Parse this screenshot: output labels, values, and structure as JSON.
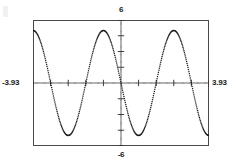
{
  "plot": {
    "x_min_label": "-3.93",
    "x_max_label": "3.93",
    "y_max_label": "6",
    "y_min_label": "-6",
    "frame_color": "#4a4a4a",
    "curve_color": "#1a1a1a",
    "axis_color": "#2b2b2b"
  },
  "chart_data": {
    "type": "line",
    "title": "",
    "subtitle": "",
    "xlabel": "",
    "ylabel": "",
    "xlim": [
      -3.93,
      3.93
    ],
    "ylim": [
      -6,
      6
    ],
    "grid": false,
    "legend": null,
    "style": "dotted-pixel-trace",
    "x_tick_labels": [
      "-3.93",
      "3.93"
    ],
    "y_tick_labels": [
      "6",
      "-6"
    ],
    "x_tick_spacing": 0.7854,
    "y_tick_spacing": 1.5,
    "annotations": [],
    "series": [
      {
        "name": "y = -5 sin(2x)",
        "expression": "-5*sin(2*x)",
        "amplitude": 5,
        "period": 3.14159,
        "x": [
          -3.93,
          -3.83,
          -3.73,
          -3.63,
          -3.53,
          -3.43,
          -3.33,
          -3.23,
          -3.13,
          -3.03,
          -2.93,
          -2.83,
          -2.73,
          -2.63,
          -2.53,
          -2.43,
          -2.33,
          -2.23,
          -2.13,
          -2.03,
          -1.93,
          -1.83,
          -1.73,
          -1.63,
          -1.53,
          -1.43,
          -1.33,
          -1.23,
          -1.13,
          -1.03,
          -0.93,
          -0.83,
          -0.73,
          -0.63,
          -0.53,
          -0.43,
          -0.33,
          -0.23,
          -0.13,
          -0.03,
          0.07,
          0.17,
          0.27,
          0.37,
          0.47,
          0.57,
          0.67,
          0.77,
          0.87,
          0.97,
          1.07,
          1.17,
          1.27,
          1.37,
          1.47,
          1.57,
          1.67,
          1.77,
          1.87,
          1.97,
          2.07,
          2.17,
          2.27,
          2.37,
          2.47,
          2.57,
          2.67,
          2.77,
          2.87,
          2.97,
          3.07,
          3.17,
          3.27,
          3.37,
          3.47,
          3.57,
          3.67,
          3.77,
          3.87,
          3.93
        ],
        "y": [
          -0.71,
          -1.64,
          -2.53,
          -3.33,
          -4.03,
          -4.58,
          -4.9,
          -4.99,
          -4.87,
          -4.52,
          -3.96,
          -3.22,
          -2.34,
          -1.37,
          -0.34,
          0.69,
          1.7,
          2.63,
          3.44,
          4.11,
          4.61,
          4.91,
          4.99,
          4.85,
          4.48,
          3.9,
          3.15,
          2.25,
          1.27,
          0.24,
          -0.8,
          -1.79,
          -2.7,
          -3.49,
          -4.14,
          -4.61,
          -4.88,
          -4.95,
          -4.79,
          -4.4,
          -3.81,
          -3.04,
          -2.13,
          -1.15,
          -0.13,
          0.9,
          1.88,
          2.77,
          3.53,
          4.15,
          4.58,
          4.83,
          4.87,
          4.71,
          4.35,
          3.79,
          3.07,
          2.21,
          1.26,
          0.25,
          -0.76,
          -1.74,
          -2.65,
          -3.45,
          -4.11,
          -4.6,
          -4.89,
          -4.97,
          -4.84,
          -4.49,
          -3.94,
          -3.2,
          -2.32,
          -1.34,
          -0.31,
          0.72,
          1.72,
          2.65,
          3.46,
          3.93
        ]
      }
    ]
  }
}
